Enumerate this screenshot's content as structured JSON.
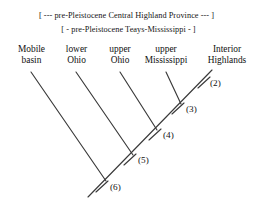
{
  "figure": {
    "type": "cladogram",
    "brackets": [
      {
        "id": "province",
        "text": "[ --- pre-Pleistocene Central Highland Province --- ]"
      },
      {
        "id": "teays",
        "text": "[ - pre-Pleistocene Teays-Mississippi - ]"
      }
    ],
    "taxa": [
      {
        "id": "mobile-basin",
        "line1": "Mobile",
        "line2": "basin"
      },
      {
        "id": "lower-ohio",
        "line1": "lower",
        "line2": "Ohio"
      },
      {
        "id": "upper-ohio",
        "line1": "upper",
        "line2": "Ohio"
      },
      {
        "id": "upper-mississippi",
        "line1": "upper",
        "line2": "Mississippi"
      },
      {
        "id": "interior-highlands",
        "line1": "Interior",
        "line2": "Highlands"
      }
    ],
    "nodes": [
      {
        "id": "node-2",
        "label": "(2)"
      },
      {
        "id": "node-3",
        "label": "(3)"
      },
      {
        "id": "node-4",
        "label": "(4)"
      },
      {
        "id": "node-5",
        "label": "(5)"
      },
      {
        "id": "node-6",
        "label": "(6)"
      }
    ],
    "colors": {
      "background": "#ffffff",
      "ink": "#1a1a1a",
      "line": "#3a3a3a"
    }
  }
}
